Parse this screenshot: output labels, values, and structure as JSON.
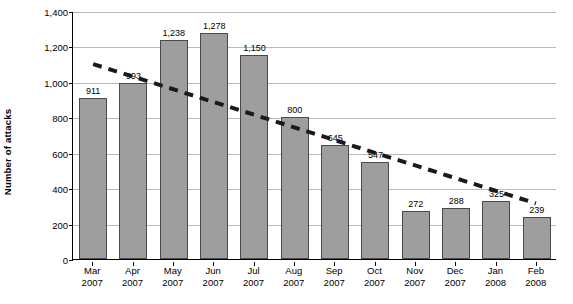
{
  "chart_data": {
    "type": "bar",
    "title": "",
    "xlabel": "",
    "ylabel": "Number of attacks",
    "ylim": [
      0,
      1400
    ],
    "yticks": [
      0,
      200,
      400,
      600,
      800,
      1000,
      1200,
      1400
    ],
    "ytick_labels": [
      "0",
      "200",
      "400",
      "600",
      "800",
      "1,000",
      "1,200",
      "1,400"
    ],
    "grid": true,
    "legend": "none",
    "categories": [
      "Mar\n2007",
      "Apr\n2007",
      "May\n2007",
      "Jun\n2007",
      "Jul\n2007",
      "Aug\n2007",
      "Sep\n2007",
      "Oct\n2007",
      "Nov\n2007",
      "Dec\n2007",
      "Jan\n2008",
      "Feb\n2008"
    ],
    "category_lines": [
      [
        "Mar",
        "2007"
      ],
      [
        "Apr",
        "2007"
      ],
      [
        "May",
        "2007"
      ],
      [
        "Jun",
        "2007"
      ],
      [
        "Jul",
        "2007"
      ],
      [
        "Aug",
        "2007"
      ],
      [
        "Sep",
        "2007"
      ],
      [
        "Oct",
        "2007"
      ],
      [
        "Nov",
        "2007"
      ],
      [
        "Dec",
        "2007"
      ],
      [
        "Jan",
        "2008"
      ],
      [
        "Feb",
        "2008"
      ]
    ],
    "values": [
      911,
      993,
      1238,
      1278,
      1150,
      800,
      645,
      547,
      272,
      288,
      325,
      239
    ],
    "value_labels": [
      "911",
      "993",
      "1,238",
      "1,278",
      "1,150",
      "800",
      "645",
      "547",
      "272",
      "288",
      "325",
      "239"
    ],
    "bar_color": "#9e9e9e",
    "bar_edge_color": "#4a4a4a",
    "annotations": [
      {
        "name": "trendline",
        "style": "dashed",
        "color": "#1a1a1a",
        "start": {
          "category_index": 0,
          "value": 1105
        },
        "end": {
          "category_index": 11,
          "value": 315
        }
      }
    ]
  }
}
